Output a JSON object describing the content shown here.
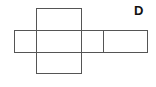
{
  "diagram": {
    "type": "net-of-cuboid",
    "label": "D",
    "faces": [
      {
        "name": "top-face"
      },
      {
        "name": "left-face"
      },
      {
        "name": "front-face"
      },
      {
        "name": "right-face"
      },
      {
        "name": "back-face"
      },
      {
        "name": "bottom-face"
      }
    ],
    "colors": {
      "stroke": "#555555",
      "label": "#111111",
      "background": "#ffffff"
    }
  }
}
